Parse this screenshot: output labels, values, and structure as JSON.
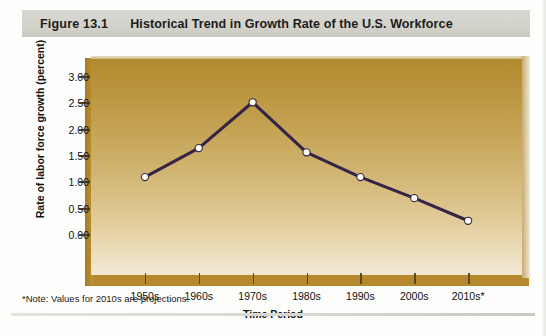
{
  "header": {
    "figure_number": "Figure 13.1",
    "title": "Historical Trend in Growth Rate of the U.S. Workforce"
  },
  "footnote": "*Note: Values for 2010s are projections.",
  "colors": {
    "line": "#342445",
    "marker_fill": "#fdfcf5",
    "marker_stroke": "#342445",
    "plot_top": "#b08a2e",
    "plot_bottom": "#f2e8d3",
    "base_platform": "#b5892c",
    "header_band": "#d6d5ce"
  },
  "chart_data": {
    "type": "line",
    "title": "Historical Trend in Growth Rate of the U.S. Workforce",
    "xlabel": "Time Period",
    "ylabel": "Rate of labor force growth (percent)",
    "categories": [
      "1950s",
      "1960s",
      "1970s",
      "1980s",
      "1990s",
      "2000s",
      "2010s*"
    ],
    "values": [
      1.1,
      1.65,
      2.52,
      1.57,
      1.1,
      0.7,
      0.27
    ],
    "ylim": [
      0.0,
      3.0
    ],
    "yticks": [
      "0.00",
      "0.50",
      "1.00",
      "1.50",
      "2.00",
      "2.50",
      "3.00"
    ],
    "ytick_values": [
      0.0,
      0.5,
      1.0,
      1.5,
      2.0,
      2.5,
      3.0
    ],
    "grid": false,
    "legend": null,
    "annotation": "*Note: Values for 2010s are projections."
  }
}
